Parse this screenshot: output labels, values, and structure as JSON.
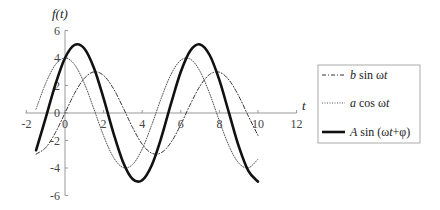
{
  "chart_data": {
    "type": "line",
    "title": "",
    "xlabel": "t",
    "ylabel": "f(t)",
    "xlim": [
      -2,
      12
    ],
    "ylim": [
      -6,
      6
    ],
    "grid": false,
    "legend_position": "right",
    "xticks": [
      -2,
      0,
      2,
      4,
      6,
      8,
      10,
      12
    ],
    "yticks": [
      -6,
      -4,
      -2,
      0,
      2,
      4,
      6
    ],
    "x": [
      -1.5,
      -1.0,
      -0.5,
      0,
      0.5,
      1.0,
      1.5,
      2.0,
      2.5,
      3.0,
      3.5,
      4.0,
      4.5,
      5.0,
      5.5,
      6.0,
      6.5,
      7.0,
      7.5,
      8.0,
      8.5,
      9.0,
      9.5,
      10.0
    ],
    "series": [
      {
        "name": "b sin ωt",
        "style": "dashdot",
        "values": [
          -2.99,
          -2.52,
          -1.44,
          0,
          1.44,
          2.52,
          2.99,
          2.73,
          1.8,
          0.42,
          -1.05,
          -2.27,
          -2.93,
          -2.88,
          -2.12,
          -0.84,
          0.65,
          1.97,
          2.81,
          2.97,
          2.4,
          1.24,
          -0.23,
          -1.63
        ]
      },
      {
        "name": "a cos ωt",
        "style": "dotted",
        "values": [
          0.28,
          2.16,
          3.51,
          4,
          3.51,
          2.16,
          0.28,
          -1.66,
          -3.2,
          -3.96,
          -3.75,
          -2.61,
          -0.84,
          1.13,
          2.83,
          3.84,
          3.91,
          3.02,
          1.39,
          -0.58,
          -2.41,
          -3.64,
          -3.99,
          -3.36
        ]
      },
      {
        "name": "A sin (ωt+φ)",
        "style": "solid-thick",
        "values": [
          -2.71,
          -0.36,
          2.07,
          4,
          4.95,
          4.69,
          3.27,
          1.06,
          -1.41,
          -3.54,
          -4.8,
          -4.89,
          -3.78,
          -1.74,
          0.72,
          3.0,
          4.55,
          4.99,
          4.2,
          2.39,
          -0.01,
          -2.41,
          -4.21,
          -4.99
        ]
      }
    ]
  },
  "axes": {
    "y_label": "f(t)",
    "x_label": "t"
  },
  "legend": {
    "items": [
      {
        "label": "b sin ωt",
        "parts": [
          {
            "t": "b",
            "i": true
          },
          {
            "t": " sin ω"
          },
          {
            "t": "t",
            "i": true
          }
        ]
      },
      {
        "label": "a cos ωt",
        "parts": [
          {
            "t": "a",
            "i": true
          },
          {
            "t": " cos ω"
          },
          {
            "t": "t",
            "i": true
          }
        ]
      },
      {
        "label": "A sin (ωt+φ)",
        "parts": [
          {
            "t": "A",
            "i": true
          },
          {
            "t": " sin (ω"
          },
          {
            "t": "t",
            "i": true
          },
          {
            "t": "+φ)"
          }
        ]
      }
    ]
  },
  "colors": {
    "axis": "#999999",
    "curve": "#222222",
    "legend_border": "#aaaaaa"
  }
}
